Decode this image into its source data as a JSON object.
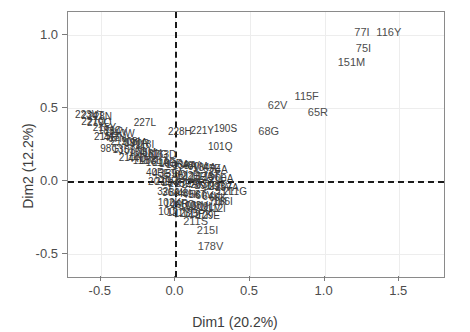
{
  "chart_data": {
    "type": "scatter",
    "title": "",
    "xlabel": "Dim1 (20.2%)",
    "ylabel": "Dim2 (12.2%)",
    "xlim": [
      -0.72,
      1.8
    ],
    "ylim": [
      -0.66,
      1.16
    ],
    "xticks": [
      -0.5,
      0.0,
      0.5,
      1.0,
      1.5
    ],
    "xticklabels": [
      "-0.5",
      "0.0",
      "0.5",
      "1.0",
      "1.5"
    ],
    "yticks": [
      -0.5,
      0.0,
      0.5,
      1.0
    ],
    "yticklabels": [
      "-0.5",
      "0.0",
      "0.5",
      "1.0"
    ],
    "grid": true,
    "reference_lines": {
      "vertical_x": 0.0,
      "horizontal_y": 0.0,
      "style": "dashed",
      "color": "#1a1a1a"
    },
    "label_color": "#4d4d4d",
    "points": [
      {
        "label": "77I",
        "x": 1.25,
        "y": 1.02
      },
      {
        "label": "116Y",
        "x": 1.43,
        "y": 1.02
      },
      {
        "label": "75I",
        "x": 1.26,
        "y": 0.91
      },
      {
        "label": "151M",
        "x": 1.18,
        "y": 0.82
      },
      {
        "label": "115F",
        "x": 0.88,
        "y": 0.585
      },
      {
        "label": "62V",
        "x": 0.685,
        "y": 0.52
      },
      {
        "label": "65R",
        "x": 0.955,
        "y": 0.475
      },
      {
        "label": "68G",
        "x": 0.625,
        "y": 0.345
      },
      {
        "label": "190S",
        "x": 0.335,
        "y": 0.355
      },
      {
        "label": "227L",
        "x": -0.205,
        "y": 0.4
      },
      {
        "label": "221Y",
        "x": 0.18,
        "y": 0.345
      },
      {
        "label": "228H",
        "x": 0.03,
        "y": 0.335
      },
      {
        "label": "101Q",
        "x": 0.3,
        "y": 0.235
      },
      {
        "label": "211G",
        "x": 0.4,
        "y": -0.075
      },
      {
        "label": "166I",
        "x": 0.32,
        "y": -0.145
      },
      {
        "label": "211S",
        "x": 0.135,
        "y": -0.275
      },
      {
        "label": "215I",
        "x": 0.215,
        "y": -0.335
      },
      {
        "label": "178V",
        "x": 0.235,
        "y": -0.445
      },
      {
        "label": "223V",
        "x": -0.595,
        "y": 0.455
      },
      {
        "label": "228N",
        "x": -0.505,
        "y": 0.44
      },
      {
        "label": "224T",
        "x": -0.555,
        "y": 0.445
      },
      {
        "label": "227Q",
        "x": -0.55,
        "y": 0.405
      },
      {
        "label": "219Q",
        "x": -0.51,
        "y": 0.395
      },
      {
        "label": "215Y",
        "x": -0.475,
        "y": 0.36
      },
      {
        "label": "181C",
        "x": -0.44,
        "y": 0.345
      },
      {
        "label": "184V",
        "x": -0.4,
        "y": 0.335
      },
      {
        "label": "210W",
        "x": -0.36,
        "y": 0.32
      },
      {
        "label": "215F",
        "x": -0.47,
        "y": 0.3
      },
      {
        "label": "41L",
        "x": -0.425,
        "y": 0.295
      },
      {
        "label": "67N",
        "x": -0.39,
        "y": 0.285
      },
      {
        "label": "219N",
        "x": -0.355,
        "y": 0.27
      },
      {
        "label": "108I",
        "x": -0.3,
        "y": 0.265
      },
      {
        "label": "190A",
        "x": -0.265,
        "y": 0.26
      },
      {
        "label": "70R",
        "x": -0.235,
        "y": 0.255
      },
      {
        "label": "118I",
        "x": -0.205,
        "y": 0.25
      },
      {
        "label": "98G",
        "x": -0.44,
        "y": 0.22
      },
      {
        "label": "135T",
        "x": -0.345,
        "y": 0.215
      },
      {
        "label": "103N",
        "x": -0.3,
        "y": 0.205
      },
      {
        "label": "184I",
        "x": -0.25,
        "y": 0.195
      },
      {
        "label": "75M",
        "x": -0.195,
        "y": 0.19
      },
      {
        "label": "181I",
        "x": -0.155,
        "y": 0.185
      },
      {
        "label": "67G",
        "x": -0.115,
        "y": 0.18
      },
      {
        "label": "163D",
        "x": -0.075,
        "y": 0.175
      },
      {
        "label": "210N",
        "x": -0.3,
        "y": 0.155
      },
      {
        "label": "44D",
        "x": -0.255,
        "y": 0.15
      },
      {
        "label": "118V",
        "x": -0.21,
        "y": 0.14
      },
      {
        "label": "188L",
        "x": -0.165,
        "y": 0.135
      },
      {
        "label": "151A",
        "x": -0.12,
        "y": 0.125
      },
      {
        "label": "219E",
        "x": -0.075,
        "y": 0.12
      },
      {
        "label": "103R",
        "x": -0.03,
        "y": 0.115
      },
      {
        "label": "106A",
        "x": 0.015,
        "y": 0.11
      },
      {
        "label": "138A",
        "x": 0.06,
        "y": 0.105
      },
      {
        "label": "48V",
        "x": 0.105,
        "y": 0.1
      },
      {
        "label": "90M",
        "x": 0.15,
        "y": 0.095
      },
      {
        "label": "184A",
        "x": 0.195,
        "y": 0.09
      },
      {
        "label": "65E",
        "x": 0.245,
        "y": 0.085
      },
      {
        "label": "74A",
        "x": 0.29,
        "y": 0.075
      },
      {
        "label": "40F",
        "x": -0.14,
        "y": 0.055
      },
      {
        "label": "43E",
        "x": -0.095,
        "y": 0.05
      },
      {
        "label": "35T",
        "x": -0.05,
        "y": 0.045
      },
      {
        "label": "39A",
        "x": -0.005,
        "y": 0.045
      },
      {
        "label": "60I",
        "x": 0.04,
        "y": 0.04
      },
      {
        "label": "122E",
        "x": 0.085,
        "y": 0.035
      },
      {
        "label": "123E",
        "x": 0.13,
        "y": 0.03
      },
      {
        "label": "162A",
        "x": 0.175,
        "y": 0.03
      },
      {
        "label": "173T",
        "x": 0.22,
        "y": 0.025
      },
      {
        "label": "196E",
        "x": 0.265,
        "y": 0.02
      },
      {
        "label": "200A",
        "x": 0.31,
        "y": 0.015
      },
      {
        "label": "207E",
        "x": -0.105,
        "y": -0.005
      },
      {
        "label": "211R",
        "x": -0.06,
        "y": -0.01
      },
      {
        "label": "214F",
        "x": -0.015,
        "y": -0.015
      },
      {
        "label": "245E",
        "x": 0.03,
        "y": -0.02
      },
      {
        "label": "272A",
        "x": 0.075,
        "y": -0.02
      },
      {
        "label": "277K",
        "x": 0.12,
        "y": -0.025
      },
      {
        "label": "283I",
        "x": 0.165,
        "y": -0.03
      },
      {
        "label": "291D",
        "x": 0.21,
        "y": -0.035
      },
      {
        "label": "292I",
        "x": 0.255,
        "y": -0.04
      },
      {
        "label": "293V",
        "x": 0.3,
        "y": -0.045
      },
      {
        "label": "297A",
        "x": 0.345,
        "y": -0.05
      },
      {
        "label": "32I",
        "x": -0.075,
        "y": -0.075
      },
      {
        "label": "36A",
        "x": -0.03,
        "y": -0.08
      },
      {
        "label": "39K",
        "x": 0.015,
        "y": -0.085
      },
      {
        "label": "48I",
        "x": 0.06,
        "y": -0.09
      },
      {
        "label": "49K",
        "x": 0.105,
        "y": -0.095
      },
      {
        "label": "58T",
        "x": 0.15,
        "y": -0.1
      },
      {
        "label": "60V",
        "x": 0.195,
        "y": -0.105
      },
      {
        "label": "64K",
        "x": 0.24,
        "y": -0.11
      },
      {
        "label": "69K",
        "x": 0.285,
        "y": -0.115
      },
      {
        "label": "11T",
        "x": 0.33,
        "y": -0.075
      },
      {
        "label": "70K",
        "x": 0.285,
        "y": -0.145
      },
      {
        "label": "102K",
        "x": -0.04,
        "y": -0.155
      },
      {
        "label": "104R",
        "x": 0.005,
        "y": -0.16
      },
      {
        "label": "105Q",
        "x": 0.05,
        "y": -0.165
      },
      {
        "label": "106I",
        "x": 0.095,
        "y": -0.17
      },
      {
        "label": "108V",
        "x": 0.14,
        "y": -0.175
      },
      {
        "label": "109L",
        "x": 0.185,
        "y": -0.18
      },
      {
        "label": "111V",
        "x": 0.23,
        "y": -0.185
      },
      {
        "label": "112I",
        "x": 0.275,
        "y": -0.19
      },
      {
        "label": "100I",
        "x": -0.05,
        "y": -0.215
      },
      {
        "label": "121Y",
        "x": 0.02,
        "y": -0.22
      },
      {
        "label": "123D",
        "x": 0.07,
        "y": -0.225
      },
      {
        "label": "125P",
        "x": 0.12,
        "y": -0.23
      },
      {
        "label": "127K",
        "x": 0.17,
        "y": -0.235
      },
      {
        "label": "129E",
        "x": 0.22,
        "y": -0.24
      }
    ]
  }
}
